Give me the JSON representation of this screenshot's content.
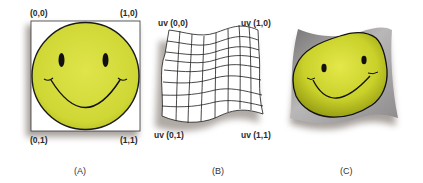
{
  "panels": [
    {
      "id": "A",
      "caption": "(A)",
      "corners": {
        "top_left": "(0,0)",
        "top_right": "(1,0)",
        "bottom_left": "(0,1)",
        "bottom_right": "(1,1)"
      },
      "description": "texture image with smiley face"
    },
    {
      "id": "B",
      "caption": "(B)",
      "corners": {
        "top_left": "uv (0,0)",
        "top_right": "uv (1,0)",
        "bottom_left": "uv (0,1)",
        "bottom_right": "uv (1,1)"
      },
      "description": "warped 3D surface mesh grid",
      "grid": {
        "columns": 8,
        "rows": 8
      }
    },
    {
      "id": "C",
      "caption": "(C)",
      "description": "texture mapped onto warped surface"
    }
  ],
  "colors": {
    "face_yellow": "#d6de3c",
    "face_yellow_dark": "#a9b21c",
    "outline": "#1a1a1a",
    "surface_gray": "#9a9898",
    "shadow": "#7a6f66"
  }
}
